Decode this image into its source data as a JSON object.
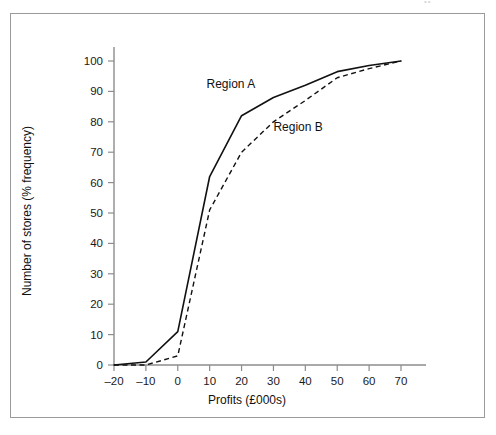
{
  "page": {
    "header_remnant": "••"
  },
  "chart_data": {
    "type": "line",
    "title": "",
    "subtitle": "",
    "xlabel": "Profits (£000s)",
    "ylabel": "Number of stores (% frequency)",
    "xlim": [
      -20,
      70
    ],
    "ylim": [
      0,
      100
    ],
    "xticks": [
      -20,
      -10,
      0,
      10,
      20,
      30,
      40,
      50,
      60,
      70
    ],
    "xticklabels": [
      "–20",
      "–10",
      "0",
      "10",
      "20",
      "30",
      "40",
      "50",
      "60",
      "70"
    ],
    "yticks": [
      0,
      10,
      20,
      30,
      40,
      50,
      60,
      70,
      80,
      90,
      100
    ],
    "yticklabels": [
      "0",
      "10",
      "20",
      "30",
      "40",
      "50",
      "60",
      "70",
      "80",
      "90",
      "100"
    ],
    "grid": false,
    "legend_position": "inline-annotation",
    "x": [
      -20,
      -10,
      0,
      10,
      20,
      30,
      40,
      50,
      60,
      70
    ],
    "series": [
      {
        "name": "Region A",
        "style": "solid",
        "color": "#111111",
        "values": [
          0,
          1,
          11,
          62,
          82,
          88,
          92,
          96.5,
          98.5,
          100
        ],
        "label_text": "Region A",
        "label_x": 9,
        "label_y": 91
      },
      {
        "name": "Region B",
        "style": "dashed",
        "color": "#111111",
        "values": [
          0,
          0,
          3,
          51,
          70,
          80,
          87,
          94.5,
          97.5,
          100
        ],
        "label_text": "Region B",
        "label_x": 30,
        "label_y": 77
      }
    ],
    "annotations": [
      {
        "text": "Region A",
        "x": 9,
        "y": 91
      },
      {
        "text": "Region B",
        "x": 30,
        "y": 77
      }
    ]
  }
}
